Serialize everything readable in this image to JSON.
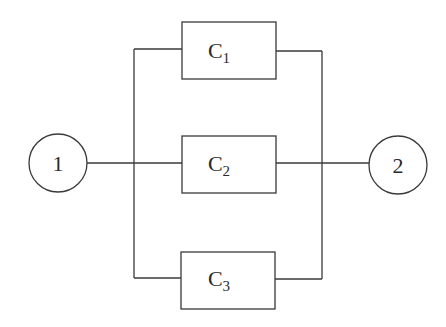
{
  "diagram": {
    "type": "parallel-network",
    "nodes": [
      {
        "id": "1",
        "label": "1",
        "cx": 58,
        "cy": 163,
        "r": 29
      },
      {
        "id": "2",
        "label": "2",
        "cx": 398,
        "cy": 165,
        "r": 29
      }
    ],
    "components": [
      {
        "id": "C1",
        "base": "C",
        "subscript": "1",
        "x": 182,
        "y": 22,
        "w": 94,
        "h": 57
      },
      {
        "id": "C2",
        "base": "C",
        "subscript": "2",
        "x": 182,
        "y": 136,
        "w": 94,
        "h": 57
      },
      {
        "id": "C3",
        "base": "C",
        "subscript": "3",
        "x": 181,
        "y": 252,
        "w": 94,
        "h": 57
      }
    ],
    "edges": [
      {
        "from": "1",
        "to": "C1"
      },
      {
        "from": "1",
        "to": "C2"
      },
      {
        "from": "1",
        "to": "C3"
      },
      {
        "from": "C1",
        "to": "2"
      },
      {
        "from": "C2",
        "to": "2"
      },
      {
        "from": "C3",
        "to": "2"
      }
    ],
    "colors": {
      "stroke": "#3a3a3a",
      "text": "#2a2a2a",
      "background": "#ffffff"
    }
  }
}
